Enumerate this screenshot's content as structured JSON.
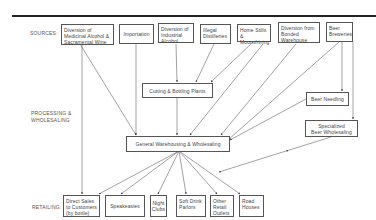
{
  "diagram": {
    "sections": {
      "sources": "SOURCES:",
      "processing": "PROCESSING &\nWHOLESALING",
      "retailing": "RETAILING:"
    },
    "sources": [
      {
        "id": "medicinal",
        "label": "Diversion of\nMedicinal Alcohol &\nSacramental Wine"
      },
      {
        "id": "importation",
        "label": "Importation"
      },
      {
        "id": "industrial",
        "label": "Diversion of\nIndustrial\nAlcohol"
      },
      {
        "id": "illegal",
        "label": "Illegal\nDistilleries"
      },
      {
        "id": "homestills",
        "label": "Home Stills &\nMoonshining"
      },
      {
        "id": "bonded",
        "label": "Diversion from\nBonded\nWarehouse"
      },
      {
        "id": "breweries",
        "label": "Beer\nBreweries"
      }
    ],
    "processing": [
      {
        "id": "cutting",
        "label": "Cutting & Bottling Plants"
      },
      {
        "id": "needling",
        "label": "Beer Needling"
      },
      {
        "id": "specialized",
        "label": "Specialized\nBeer Wholesaling"
      },
      {
        "id": "general",
        "label": "General Warehousing & Wholesaling"
      }
    ],
    "retail": [
      {
        "id": "direct",
        "label": "Direct Sales\nto Customers\n(by bottle)"
      },
      {
        "id": "speakeasies",
        "label": "Speakeasies"
      },
      {
        "id": "nightclubs",
        "label": "Night\nClubs"
      },
      {
        "id": "softdrink",
        "label": "Soft Drink\nParlors"
      },
      {
        "id": "otherretail",
        "label": "Other\nRetail\nOutlets"
      },
      {
        "id": "roadhouses",
        "label": "Road\nHouses"
      }
    ],
    "edges": [
      [
        "medicinal",
        "general"
      ],
      [
        "medicinal",
        "direct"
      ],
      [
        "importation",
        "general"
      ],
      [
        "industrial",
        "cutting"
      ],
      [
        "illegal",
        "cutting"
      ],
      [
        "homestills",
        "cutting"
      ],
      [
        "homestills",
        "general"
      ],
      [
        "bonded",
        "general"
      ],
      [
        "breweries",
        "general"
      ],
      [
        "breweries",
        "needling"
      ],
      [
        "breweries",
        "specialized"
      ],
      [
        "needling",
        "general"
      ],
      [
        "cutting",
        "general"
      ],
      [
        "specialized",
        "retail"
      ],
      [
        "general",
        "direct"
      ],
      [
        "general",
        "speakeasies"
      ],
      [
        "general",
        "nightclubs"
      ],
      [
        "general",
        "softdrink"
      ],
      [
        "general",
        "otherretail"
      ],
      [
        "general",
        "roadhouses"
      ]
    ]
  }
}
